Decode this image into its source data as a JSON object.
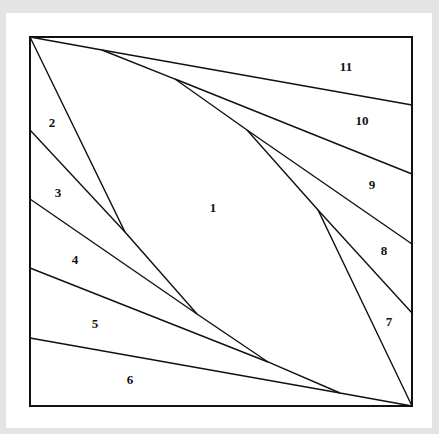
{
  "diagram": {
    "type": "quilt-block-pattern",
    "frame": {
      "x1": 30,
      "y1": 37,
      "x2": 412,
      "y2": 406
    },
    "line_color": "#111111",
    "background": "#e4e4e4",
    "card_background": "#ffffff",
    "regions": [
      {
        "id": "1",
        "label": "1",
        "x": 213,
        "y": 209
      },
      {
        "id": "2",
        "label": "2",
        "x": 52,
        "y": 124
      },
      {
        "id": "3",
        "label": "3",
        "x": 58,
        "y": 194
      },
      {
        "id": "4",
        "label": "4",
        "x": 75,
        "y": 261
      },
      {
        "id": "5",
        "label": "5",
        "x": 95,
        "y": 325
      },
      {
        "id": "6",
        "label": "6",
        "x": 130,
        "y": 381
      },
      {
        "id": "7",
        "label": "7",
        "x": 389,
        "y": 323
      },
      {
        "id": "8",
        "label": "8",
        "x": 384,
        "y": 252
      },
      {
        "id": "9",
        "label": "9",
        "x": 372,
        "y": 186
      },
      {
        "id": "10",
        "label": "10",
        "x": 362,
        "y": 122
      },
      {
        "id": "11",
        "label": "11",
        "x": 346,
        "y": 68
      }
    ]
  }
}
